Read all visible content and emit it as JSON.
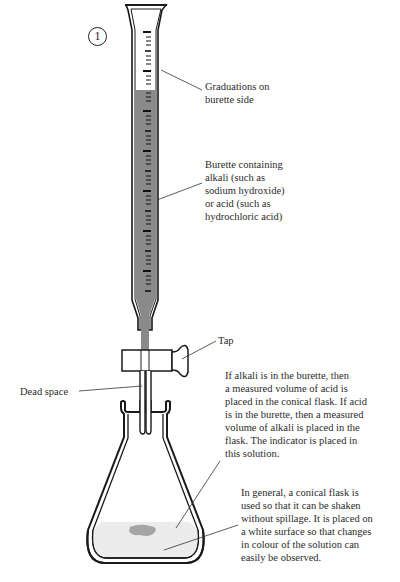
{
  "figure": {
    "step_number": "1",
    "labels": {
      "graduations": "Graduations on\nburette side",
      "burette": "Burette containing\nalkali (such as\nsodium hydroxide)\nor acid (such as\nhydrochloric acid)",
      "tap": "Tap",
      "dead_space": "Dead space",
      "flask_contents": "If alkali is in the burette, then\na measured volume of acid is\nplaced in the conical flask. If acid\nis in the burette, then a measured\nvolume of alkali is placed in the\nflask. The indicator is placed in\nthis solution.",
      "conical_flask": "In general, a conical flask is\nused so that it can be shaken\nwithout spillage. It is placed on\na white surface so that changes\nin colour of the solution can\neasily be observed."
    },
    "colors": {
      "outline": "#1a1a1a",
      "burette_liquid": "#8a8a8a",
      "flask_solution": "#ececec",
      "indicator_spot": "#a5a5a5",
      "leader_line": "#333333"
    }
  }
}
